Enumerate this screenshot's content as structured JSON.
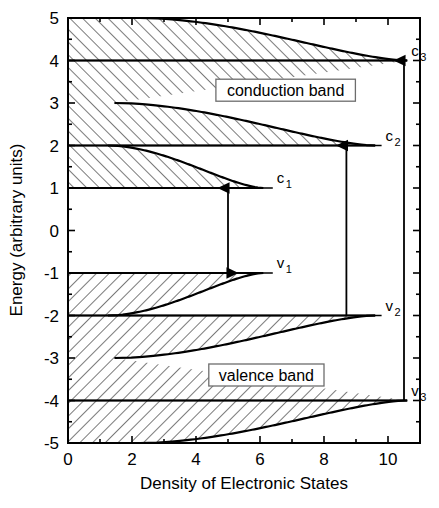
{
  "chart_data": {
    "type": "area",
    "title": "",
    "xlabel": "Density of Electronic States",
    "ylabel": "Energy (arbitrary units)",
    "xlim": [
      0,
      11
    ],
    "ylim": [
      -5,
      5
    ],
    "xticks_major": [
      0,
      2,
      4,
      6,
      8,
      10
    ],
    "xticks_minor": [
      1,
      3,
      5,
      7,
      9,
      11
    ],
    "yticks": [
      5,
      4,
      3,
      2,
      1,
      0,
      -1,
      -2,
      -3,
      -4,
      -5
    ],
    "xtick_labels": [
      "0",
      "2",
      "4",
      "6",
      "8",
      "10"
    ],
    "ytick_labels": [
      "5",
      "4",
      "3",
      "2",
      "1",
      "0",
      "-1",
      "-2",
      "-3",
      "-4",
      "-5"
    ],
    "grid": false,
    "legend": "none",
    "subband_edges": {
      "conduction": [
        1,
        2,
        4
      ],
      "valence": [
        -1,
        -2,
        -4
      ]
    },
    "band_gap": 2,
    "series": [
      {
        "name": "conduction-subband-c1",
        "edge_energy": 1,
        "asymptote_dos": 1.25,
        "plateau_dos": 6.1
      },
      {
        "name": "conduction-subband-c2",
        "edge_energy": 2,
        "asymptote_dos": 1.45,
        "plateau_dos": 9.6
      },
      {
        "name": "conduction-subband-c3",
        "edge_energy": 4,
        "asymptote_dos": 2.25,
        "plateau_dos": 10.6
      },
      {
        "name": "conduction-subband-c4",
        "edge_energy": 5,
        "asymptote_dos": 3.9,
        "plateau_dos": 10.6
      },
      {
        "name": "valence-subband-v1",
        "edge_energy": -1,
        "asymptote_dos": 1.25,
        "plateau_dos": 6.1
      },
      {
        "name": "valence-subband-v2",
        "edge_energy": -2,
        "asymptote_dos": 1.45,
        "plateau_dos": 9.6
      },
      {
        "name": "valence-subband-v3",
        "edge_energy": -4,
        "asymptote_dos": 2.25,
        "plateau_dos": 10.6
      },
      {
        "name": "valence-subband-v4",
        "edge_energy": -5,
        "asymptote_dos": 3.9,
        "plateau_dos": 10.6
      }
    ],
    "annotations": {
      "band_labels": [
        {
          "id": "conduction-band",
          "text": "conduction band",
          "energy": 3.3,
          "dos": 6.8
        },
        {
          "id": "valence-band",
          "text": "valence band",
          "energy": -3.4,
          "dos": 6.2
        }
      ],
      "level_labels": [
        {
          "id": "c1",
          "base": "c",
          "sub": "1",
          "energy": 1,
          "dos": 6.4
        },
        {
          "id": "c2",
          "base": "c",
          "sub": "2",
          "energy": 2,
          "dos": 9.8
        },
        {
          "id": "c3",
          "base": "c",
          "sub": "3",
          "energy": 4,
          "dos": 10.6
        },
        {
          "id": "v1",
          "base": "v",
          "sub": "1",
          "energy": -1,
          "dos": 6.4
        },
        {
          "id": "v2",
          "base": "v",
          "sub": "2",
          "energy": -2,
          "dos": 9.8
        },
        {
          "id": "v3",
          "base": "v",
          "sub": "3",
          "energy": -4,
          "dos": 10.6
        }
      ],
      "transitions": [
        {
          "id": "transition-v1-c1",
          "dos": 5.0,
          "from_energy": -1,
          "to_energy": 1,
          "heads": "both"
        },
        {
          "id": "transition-v2-c2",
          "dos": 8.7,
          "from_energy": -2,
          "to_energy": 2,
          "heads": "up"
        },
        {
          "id": "transition-v3-c3",
          "dos": 10.5,
          "from_energy": -4,
          "to_energy": 4,
          "heads": "up"
        }
      ]
    }
  },
  "axis": {
    "x_title": "Density of Electronic States",
    "y_title": "Energy (arbitrary units)"
  },
  "labels": {
    "conduction_band": "conduction band",
    "valence_band": "valence band"
  }
}
